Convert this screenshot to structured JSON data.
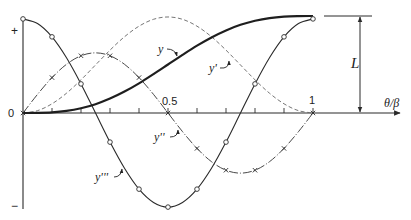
{
  "chart_data": {
    "type": "line",
    "title": "",
    "xlabel": "θ/β",
    "ylabel": "",
    "xlim": [
      0,
      1
    ],
    "x_tick_labels": [
      "0",
      "0.5",
      "1"
    ],
    "x_minor_ticks": [
      0.1,
      0.2,
      0.3,
      0.4,
      0.5,
      0.6,
      0.7,
      0.8,
      0.9,
      1.0
    ],
    "y_axis_labels": {
      "top": "+",
      "zero": "0",
      "bottom": "−"
    },
    "grid": false,
    "legend": "inline labels with leader arrows",
    "annotations": [
      {
        "text": "L",
        "meaning": "total rise (dimension arrow from axis to final y)"
      }
    ],
    "x": [
      0,
      0.05,
      0.1,
      0.15,
      0.2,
      0.25,
      0.3,
      0.35,
      0.4,
      0.45,
      0.5,
      0.55,
      0.6,
      0.65,
      0.7,
      0.75,
      0.8,
      0.85,
      0.9,
      0.95,
      1.0
    ],
    "series": [
      {
        "name": "y",
        "style": "thick solid",
        "marker": "none",
        "values": [
          0,
          0.001,
          0.006,
          0.021,
          0.049,
          0.091,
          0.149,
          0.221,
          0.306,
          0.401,
          0.5,
          0.599,
          0.694,
          0.779,
          0.851,
          0.909,
          0.951,
          0.979,
          0.994,
          0.999,
          1.0
        ]
      },
      {
        "name": "y'",
        "style": "dashed",
        "marker": "none",
        "values": [
          0,
          0.024,
          0.095,
          0.204,
          0.342,
          0.495,
          0.648,
          0.786,
          0.895,
          0.966,
          0.99,
          0.966,
          0.895,
          0.786,
          0.648,
          0.495,
          0.342,
          0.204,
          0.095,
          0.024,
          0
        ]
      },
      {
        "name": "y''",
        "style": "dash-dot",
        "marker": "cross",
        "values": [
          0,
          0.192,
          0.365,
          0.502,
          0.59,
          0.62,
          0.59,
          0.502,
          0.365,
          0.192,
          0,
          -0.192,
          -0.365,
          -0.502,
          -0.59,
          -0.62,
          -0.59,
          -0.502,
          -0.365,
          -0.192,
          0
        ]
      },
      {
        "name": "y'''",
        "style": "thin solid",
        "marker": "circle",
        "values": [
          0.97,
          0.922,
          0.785,
          0.57,
          0.3,
          0,
          -0.3,
          -0.57,
          -0.785,
          -0.922,
          -0.97,
          -0.922,
          -0.785,
          -0.57,
          -0.3,
          0,
          0.3,
          0.57,
          0.785,
          0.922,
          0.97
        ]
      }
    ],
    "marker_x": [
      0,
      0.1,
      0.2,
      0.3,
      0.4,
      0.5,
      0.6,
      0.7,
      0.8,
      0.9,
      1.0
    ],
    "y_units": "fraction of L (y = 1 at θ/β = 1)"
  },
  "labels": {
    "plus": "+",
    "zero": "0",
    "minus": "−",
    "half": "0.5",
    "one": "1",
    "xlabel": "θ/β",
    "L": "L",
    "y": "y",
    "y1": "y'",
    "y2": "y''",
    "y3": "y'''"
  }
}
